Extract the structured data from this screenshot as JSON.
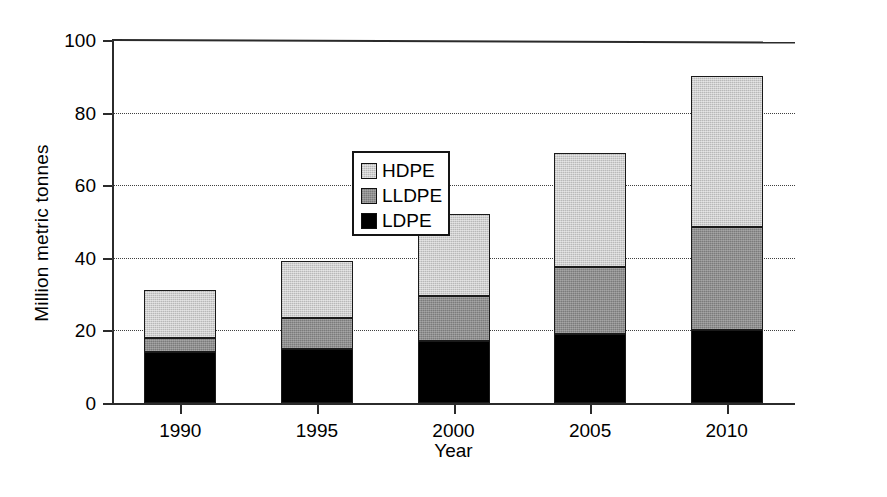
{
  "chart_data": {
    "type": "bar",
    "subtype": "stacked-bar",
    "title": "",
    "xlabel": "Year",
    "ylabel": "Million metric tonnes",
    "categories": [
      "1990",
      "1995",
      "2000",
      "2005",
      "2010"
    ],
    "series": [
      {
        "name": "LDPE",
        "values": [
          14,
          15,
          17,
          19,
          20
        ],
        "color": "#000000"
      },
      {
        "name": "LLDPE",
        "values": [
          4,
          8.5,
          12.5,
          18.5,
          28.5
        ],
        "color": "#8f8f8f"
      },
      {
        "name": "HDPE",
        "values": [
          13,
          15.5,
          22.5,
          31.5,
          41.5
        ],
        "color": "#cfcfcf"
      }
    ],
    "stack_totals": [
      31,
      39,
      52,
      69,
      90
    ],
    "cumulative_tops": {
      "LDPE": [
        14,
        15,
        17,
        19,
        20
      ],
      "LLDPE": [
        18,
        23.5,
        29.5,
        37.5,
        48.5
      ],
      "HDPE": [
        31,
        39,
        52,
        69,
        90
      ]
    },
    "ylim": [
      0,
      100
    ],
    "yticks": [
      0,
      20,
      40,
      60,
      80,
      100
    ],
    "ytick_labels": [
      "0",
      "20",
      "40",
      "60",
      "80",
      "100"
    ],
    "grid": true,
    "grid_style": "dotted",
    "legend": {
      "position": "upper-left-inside",
      "entries": [
        {
          "label": "HDPE",
          "color": "#cfcfcf"
        },
        {
          "label": "LLDPE",
          "color": "#8f8f8f"
        },
        {
          "label": "LDPE",
          "color": "#000000"
        }
      ]
    }
  }
}
